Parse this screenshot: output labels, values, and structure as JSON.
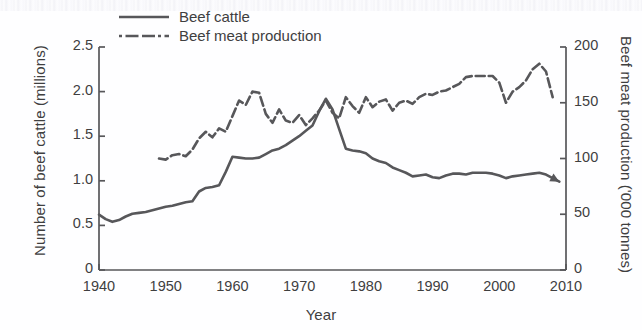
{
  "chart_data": {
    "type": "line",
    "title": "",
    "xlabel": "Year",
    "ylabel": "Number of beef cattle (millions)",
    "y2label": "Beef meat production ('000 tonnes)",
    "xlim": [
      1940,
      2010
    ],
    "ylim": [
      0,
      2.5
    ],
    "y2lim": [
      0,
      200
    ],
    "xticks": [
      "1940",
      "1950",
      "1960",
      "1970",
      "1980",
      "1990",
      "2000",
      "2010"
    ],
    "xtick_values": [
      1940,
      1950,
      1960,
      1970,
      1980,
      1990,
      2000,
      2010
    ],
    "yticks": [
      "0",
      "0.5",
      "1.0",
      "1.5",
      "2.0",
      "2.5"
    ],
    "ytick_values": [
      0,
      0.5,
      1.0,
      1.5,
      2.0,
      2.5
    ],
    "y2ticks": [
      "0",
      "50",
      "100",
      "150",
      "200"
    ],
    "y2tick_values": [
      0,
      50,
      100,
      150,
      200
    ],
    "grid": false,
    "legend_position": "top-center",
    "line_color": "#57575a",
    "series": [
      {
        "name": "Beef cattle",
        "axis": "left",
        "style": "solid",
        "end_marker": "arrow",
        "x": [
          1940,
          1941,
          1942,
          1943,
          1944,
          1945,
          1946,
          1947,
          1948,
          1949,
          1950,
          1951,
          1952,
          1953,
          1954,
          1955,
          1956,
          1957,
          1958,
          1959,
          1960,
          1961,
          1962,
          1963,
          1964,
          1965,
          1966,
          1967,
          1968,
          1969,
          1970,
          1971,
          1972,
          1973,
          1974,
          1975,
          1976,
          1977,
          1978,
          1979,
          1980,
          1981,
          1982,
          1983,
          1984,
          1985,
          1986,
          1987,
          1988,
          1989,
          1990,
          1991,
          1992,
          1993,
          1994,
          1995,
          1996,
          1997,
          1998,
          1999,
          2000,
          2001,
          2002,
          2003,
          2004,
          2005,
          2006,
          2007,
          2008,
          2009
        ],
        "values": [
          0.62,
          0.57,
          0.54,
          0.56,
          0.6,
          0.63,
          0.64,
          0.65,
          0.67,
          0.69,
          0.71,
          0.72,
          0.74,
          0.76,
          0.77,
          0.88,
          0.92,
          0.93,
          0.95,
          1.1,
          1.27,
          1.26,
          1.25,
          1.25,
          1.26,
          1.3,
          1.34,
          1.36,
          1.4,
          1.45,
          1.5,
          1.56,
          1.62,
          1.78,
          1.92,
          1.8,
          1.58,
          1.36,
          1.34,
          1.33,
          1.31,
          1.25,
          1.22,
          1.2,
          1.15,
          1.12,
          1.09,
          1.05,
          1.06,
          1.07,
          1.04,
          1.03,
          1.06,
          1.08,
          1.08,
          1.07,
          1.09,
          1.09,
          1.09,
          1.08,
          1.06,
          1.03,
          1.05,
          1.06,
          1.07,
          1.08,
          1.09,
          1.07,
          1.03,
          0.99
        ]
      },
      {
        "name": "Beef meat production",
        "axis": "right",
        "style": "dashed",
        "x": [
          1949,
          1950,
          1951,
          1952,
          1953,
          1954,
          1955,
          1956,
          1957,
          1958,
          1959,
          1960,
          1961,
          1962,
          1963,
          1964,
          1965,
          1966,
          1967,
          1968,
          1969,
          1970,
          1971,
          1972,
          1973,
          1974,
          1975,
          1976,
          1977,
          1978,
          1979,
          1980,
          1981,
          1982,
          1983,
          1984,
          1985,
          1986,
          1987,
          1988,
          1989,
          1990,
          1991,
          1992,
          1993,
          1994,
          1995,
          1996,
          1997,
          1998,
          1999,
          2000,
          2001,
          2002,
          2003,
          2004,
          2005,
          2006,
          2007,
          2008
        ],
        "values": [
          100,
          99,
          103,
          104,
          102,
          108,
          118,
          124,
          119,
          127,
          124,
          138,
          152,
          148,
          160,
          159,
          140,
          132,
          144,
          134,
          132,
          139,
          130,
          136,
          143,
          152,
          141,
          136,
          155,
          147,
          141,
          155,
          146,
          151,
          153,
          143,
          150,
          152,
          149,
          155,
          158,
          157,
          160,
          161,
          164,
          167,
          173,
          174,
          174,
          174,
          174,
          168,
          150,
          160,
          164,
          170,
          180,
          185,
          178,
          155
        ]
      }
    ]
  },
  "legend": {
    "items": [
      {
        "label": "Beef cattle",
        "style": "solid"
      },
      {
        "label": "Beef meat production",
        "style": "dashed"
      }
    ]
  }
}
